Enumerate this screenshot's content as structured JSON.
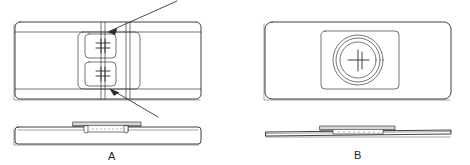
{
  "figure": {
    "type": "technical-line-drawing",
    "background_color": "#ffffff",
    "line_color": "#2b2b2b",
    "shade_color": "#d8d8d8",
    "views": [
      {
        "id": "view-a",
        "label": "A",
        "position": "left",
        "plan": {
          "name": "plan-view-a",
          "outline": "rounded-rectangle",
          "inner_panel": "rounded-rectangle",
          "vertical_guide_lines": 4,
          "crosshair_targets": 2,
          "target_symbol": "crosshair-hash"
        },
        "elevation": {
          "name": "side-elevation-a",
          "outline": "thick-slab",
          "raised_feature": "low-profile-strip",
          "perforation_dots": 9,
          "leg_tabs": 2
        },
        "callouts": [
          {
            "name": "callout-upper",
            "target": "upper-crosshair",
            "direction": "from-upper-right"
          },
          {
            "name": "callout-lower",
            "target": "lower-crosshair",
            "direction": "from-lower-right"
          }
        ]
      },
      {
        "id": "view-b",
        "label": "B",
        "position": "right",
        "plan": {
          "name": "plan-view-b",
          "outline": "rounded-rectangle",
          "inner_panel": "rounded-rectangle",
          "concentric_circles": 3,
          "target_symbol": "crosshair-plus"
        },
        "elevation": {
          "name": "side-elevation-b",
          "outline": "thin-slab",
          "raised_feature": "flat-strip",
          "perforation_dots": 9
        },
        "callouts": []
      }
    ]
  }
}
